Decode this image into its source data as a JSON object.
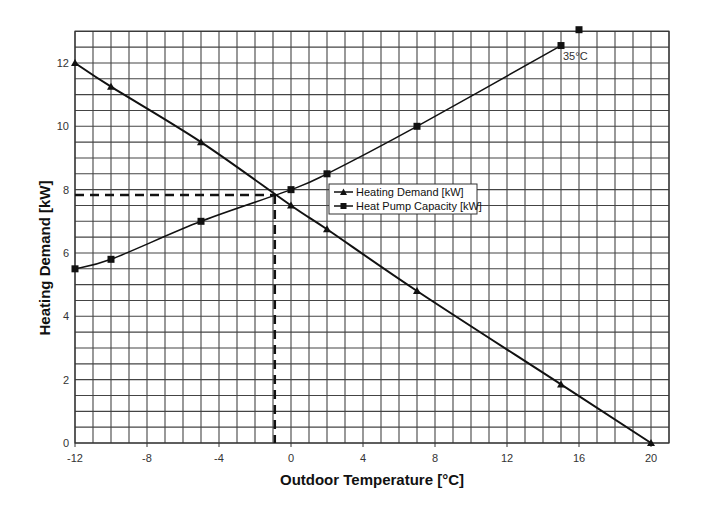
{
  "chart_data": {
    "type": "line",
    "title": "",
    "xlabel": "Outdoor Temperature [°C]",
    "ylabel": "Heating Demand [kW]",
    "xlim": [
      -12,
      21
    ],
    "ylim": [
      0,
      13
    ],
    "x_ticks": [
      -12,
      -8,
      -4,
      0,
      4,
      8,
      12,
      16,
      20
    ],
    "y_ticks": [
      0,
      2,
      4,
      6,
      8,
      10,
      12
    ],
    "grid": {
      "on": true,
      "x_step": 1,
      "y_step": 0.5
    },
    "legend_position": "center, inside plot",
    "series": [
      {
        "name": "Heating Demand [kW]",
        "marker": "triangle",
        "x": [
          -12,
          -10,
          -5,
          0,
          2,
          7,
          15,
          20
        ],
        "y": [
          12.0,
          11.25,
          9.5,
          7.5,
          6.75,
          4.8,
          1.85,
          0.0
        ]
      },
      {
        "name": "Heat Pump Capacity [kW]",
        "marker": "square",
        "x": [
          -12,
          -10,
          -5,
          0,
          2,
          7,
          15
        ],
        "y": [
          5.5,
          5.8,
          7.0,
          8.0,
          8.5,
          10.0,
          12.55
        ]
      }
    ],
    "extra_points": [
      {
        "series": "Heat Pump Capacity [kW]",
        "x": 16,
        "y": 13.05,
        "marker": "square"
      }
    ],
    "annotations": [
      {
        "text": "35°C",
        "x": 15,
        "y": 12.55
      }
    ],
    "balance_point": {
      "x": -0.9,
      "y": 7.83,
      "style": "dashed"
    }
  },
  "labels": {
    "xlabel": "Outdoor Temperature [°C]",
    "ylabel": "Heating Demand [kW]",
    "legend_demand": "Heating Demand [kW]",
    "legend_capacity": "Heat Pump Capacity [kW]",
    "annotation": "35°C"
  }
}
